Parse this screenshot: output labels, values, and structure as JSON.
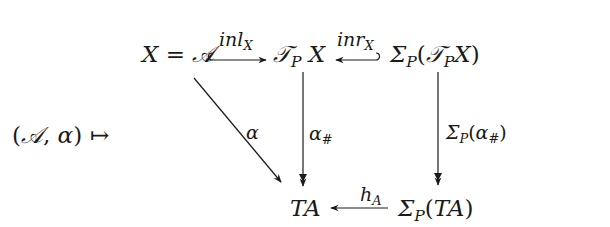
{
  "diagram": {
    "left_expr": {
      "open": "(",
      "A": "𝒜",
      "sep": ", ",
      "alpha": "α",
      "close": ")"
    },
    "mapsto": "↦",
    "nodes": {
      "XA": {
        "X": "X",
        "eq": " = ",
        "A": "𝒜"
      },
      "TPX": {
        "T": "𝒯",
        "P": "P",
        "X": " X"
      },
      "SigmaTPX": {
        "Sigma": "Σ",
        "P": "P",
        "open": "(",
        "T": "𝒯",
        "P2": "P",
        "X": "X",
        "close": ")"
      },
      "TA": {
        "text": "TA"
      },
      "SigmaTA": {
        "Sigma": "Σ",
        "P": "P",
        "open": "(",
        "T": "TA",
        "close": ")"
      }
    },
    "edges": {
      "inl": {
        "name": "inl",
        "sub": "X"
      },
      "inr": {
        "name": "inr",
        "sub": "X"
      },
      "alpha": {
        "name": "α"
      },
      "alpha_sharp": {
        "name": "α",
        "sub": "#"
      },
      "sigma_alpha_sharp": {
        "Sigma": "Σ",
        "P": "P",
        "open": "(",
        "alpha": "α",
        "sub": "#",
        "close": ")"
      },
      "hA": {
        "name": "h",
        "sub": "A"
      }
    },
    "colors": {
      "ink": "#1a1a1a",
      "background": "#ffffff"
    }
  }
}
